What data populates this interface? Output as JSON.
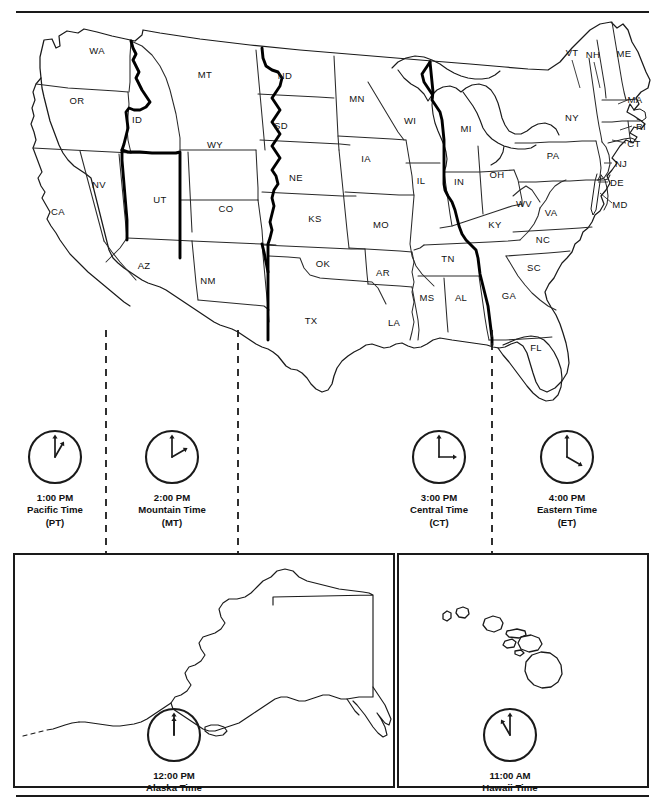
{
  "map": {
    "title": "United States Time Zone Map",
    "state_labels": [
      {
        "abbr": "WA",
        "x": 97,
        "y": 50
      },
      {
        "abbr": "OR",
        "x": 77,
        "y": 100
      },
      {
        "abbr": "ID",
        "x": 137,
        "y": 119
      },
      {
        "abbr": "MT",
        "x": 205,
        "y": 74
      },
      {
        "abbr": "ND",
        "x": 285,
        "y": 75
      },
      {
        "abbr": "SD",
        "x": 281,
        "y": 125
      },
      {
        "abbr": "MN",
        "x": 357,
        "y": 98
      },
      {
        "abbr": "WI",
        "x": 410,
        "y": 120
      },
      {
        "abbr": "MI",
        "x": 466,
        "y": 128
      },
      {
        "abbr": "WY",
        "x": 215,
        "y": 144
      },
      {
        "abbr": "NE",
        "x": 296,
        "y": 177
      },
      {
        "abbr": "IA",
        "x": 366,
        "y": 158
      },
      {
        "abbr": "IL",
        "x": 421,
        "y": 180
      },
      {
        "abbr": "IN",
        "x": 459,
        "y": 181
      },
      {
        "abbr": "OH",
        "x": 497,
        "y": 174
      },
      {
        "abbr": "NV",
        "x": 99,
        "y": 184
      },
      {
        "abbr": "UT",
        "x": 160,
        "y": 199
      },
      {
        "abbr": "CO",
        "x": 226,
        "y": 208
      },
      {
        "abbr": "KS",
        "x": 315,
        "y": 218
      },
      {
        "abbr": "MO",
        "x": 381,
        "y": 224
      },
      {
        "abbr": "KY",
        "x": 495,
        "y": 224
      },
      {
        "abbr": "CA",
        "x": 58,
        "y": 211
      },
      {
        "abbr": "AZ",
        "x": 144,
        "y": 265
      },
      {
        "abbr": "NM",
        "x": 208,
        "y": 280
      },
      {
        "abbr": "OK",
        "x": 323,
        "y": 263
      },
      {
        "abbr": "AR",
        "x": 383,
        "y": 272
      },
      {
        "abbr": "TN",
        "x": 448,
        "y": 258
      },
      {
        "abbr": "TX",
        "x": 311,
        "y": 320
      },
      {
        "abbr": "LA",
        "x": 394,
        "y": 322
      },
      {
        "abbr": "MS",
        "x": 427,
        "y": 297
      },
      {
        "abbr": "AL",
        "x": 461,
        "y": 297
      },
      {
        "abbr": "GA",
        "x": 509,
        "y": 295
      },
      {
        "abbr": "SC",
        "x": 534,
        "y": 267
      },
      {
        "abbr": "NC",
        "x": 543,
        "y": 239
      },
      {
        "abbr": "VA",
        "x": 551,
        "y": 212
      },
      {
        "abbr": "WV",
        "x": 524,
        "y": 203
      },
      {
        "abbr": "PA",
        "x": 553,
        "y": 155
      },
      {
        "abbr": "NY",
        "x": 572,
        "y": 117
      },
      {
        "abbr": "FL",
        "x": 536,
        "y": 347
      },
      {
        "abbr": "VT",
        "x": 572,
        "y": 52
      },
      {
        "abbr": "NH",
        "x": 593,
        "y": 54
      },
      {
        "abbr": "ME",
        "x": 624,
        "y": 53
      },
      {
        "abbr": "MA",
        "x": 635,
        "y": 99
      },
      {
        "abbr": "RI",
        "x": 641,
        "y": 126
      },
      {
        "abbr": "CT",
        "x": 634,
        "y": 143
      },
      {
        "abbr": "NJ",
        "x": 621,
        "y": 163
      },
      {
        "abbr": "DE",
        "x": 617,
        "y": 182
      },
      {
        "abbr": "MD",
        "x": 620,
        "y": 204
      }
    ]
  },
  "timezone_dividers": [
    {
      "name": "pacific-mountain-divider",
      "x": 106
    },
    {
      "name": "mountain-central-divider",
      "x": 238
    },
    {
      "name": "central-eastern-divider",
      "x": 492
    }
  ],
  "clocks": [
    {
      "name": "pacific",
      "time": "1:00 PM",
      "zone": "Pacific Time",
      "code": "(PT)",
      "hour_angle": 30,
      "minute_angle": 0,
      "cx": 55,
      "cy": 457,
      "r": 26
    },
    {
      "name": "mountain",
      "time": "2:00 PM",
      "zone": "Mountain Time",
      "code": "(MT)",
      "hour_angle": 60,
      "minute_angle": 0,
      "cx": 172,
      "cy": 457,
      "r": 26
    },
    {
      "name": "central",
      "time": "3:00 PM",
      "zone": "Central Time",
      "code": "(CT)",
      "hour_angle": 90,
      "minute_angle": 0,
      "cx": 439,
      "cy": 457,
      "r": 26
    },
    {
      "name": "eastern",
      "time": "4:00 PM",
      "zone": "Eastern Time",
      "code": "(ET)",
      "hour_angle": 120,
      "minute_angle": 0,
      "cx": 567,
      "cy": 457,
      "r": 26
    }
  ],
  "insets": [
    {
      "name": "alaska",
      "time": "12:00 PM",
      "zone": "Alaska Time",
      "hour_angle": 0,
      "minute_angle": 0,
      "cx": 174,
      "cy": 735,
      "r": 26
    },
    {
      "name": "hawaii",
      "time": "11:00 AM",
      "zone": "Hawaii Time",
      "hour_angle": -30,
      "minute_angle": 0,
      "cx": 510,
      "cy": 735,
      "r": 26
    }
  ],
  "colors": {
    "ink": "#1a1a1a",
    "border": "#111111",
    "zone_boundary": "#000000",
    "state_line": "#2a2a2a",
    "background": "#ffffff"
  }
}
